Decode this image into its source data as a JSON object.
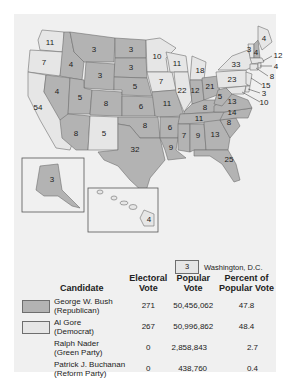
{
  "colors": {
    "republican": "#b3b3b3",
    "democrat": "#e6e6e6",
    "border": "#6e6e6e",
    "background": "#f0f0f0"
  },
  "states": [
    {
      "abbr": "WA",
      "ev": 11,
      "party": "dem"
    },
    {
      "abbr": "OR",
      "ev": 7,
      "party": "dem"
    },
    {
      "abbr": "CA",
      "ev": 54,
      "party": "dem"
    },
    {
      "abbr": "ID",
      "ev": 4,
      "party": "rep"
    },
    {
      "abbr": "NV",
      "ev": 4,
      "party": "rep"
    },
    {
      "abbr": "MT",
      "ev": 3,
      "party": "rep"
    },
    {
      "abbr": "WY",
      "ev": 3,
      "party": "rep"
    },
    {
      "abbr": "UT",
      "ev": 5,
      "party": "rep"
    },
    {
      "abbr": "AZ",
      "ev": 8,
      "party": "rep"
    },
    {
      "abbr": "CO",
      "ev": 8,
      "party": "rep"
    },
    {
      "abbr": "NM",
      "ev": 5,
      "party": "dem"
    },
    {
      "abbr": "ND",
      "ev": 3,
      "party": "rep"
    },
    {
      "abbr": "SD",
      "ev": 3,
      "party": "rep"
    },
    {
      "abbr": "NE",
      "ev": 5,
      "party": "rep"
    },
    {
      "abbr": "KS",
      "ev": 6,
      "party": "rep"
    },
    {
      "abbr": "OK",
      "ev": 8,
      "party": "rep"
    },
    {
      "abbr": "TX",
      "ev": 32,
      "party": "rep"
    },
    {
      "abbr": "MN",
      "ev": 10,
      "party": "dem"
    },
    {
      "abbr": "IA",
      "ev": 7,
      "party": "dem"
    },
    {
      "abbr": "MO",
      "ev": 11,
      "party": "rep"
    },
    {
      "abbr": "AR",
      "ev": 6,
      "party": "rep"
    },
    {
      "abbr": "LA",
      "ev": 9,
      "party": "rep"
    },
    {
      "abbr": "WI",
      "ev": 11,
      "party": "dem"
    },
    {
      "abbr": "IL",
      "ev": 22,
      "party": "dem"
    },
    {
      "abbr": "MI",
      "ev": 18,
      "party": "dem"
    },
    {
      "abbr": "IN",
      "ev": 12,
      "party": "rep"
    },
    {
      "abbr": "OH",
      "ev": 21,
      "party": "rep"
    },
    {
      "abbr": "KY",
      "ev": 8,
      "party": "rep"
    },
    {
      "abbr": "TN",
      "ev": 11,
      "party": "rep"
    },
    {
      "abbr": "MS",
      "ev": 7,
      "party": "rep"
    },
    {
      "abbr": "AL",
      "ev": 9,
      "party": "rep"
    },
    {
      "abbr": "GA",
      "ev": 13,
      "party": "rep"
    },
    {
      "abbr": "FL",
      "ev": 25,
      "party": "rep"
    },
    {
      "abbr": "SC",
      "ev": 8,
      "party": "rep"
    },
    {
      "abbr": "NC",
      "ev": 14,
      "party": "rep"
    },
    {
      "abbr": "VA",
      "ev": 13,
      "party": "rep"
    },
    {
      "abbr": "WV",
      "ev": 5,
      "party": "rep"
    },
    {
      "abbr": "PA",
      "ev": 23,
      "party": "dem"
    },
    {
      "abbr": "NY",
      "ev": 33,
      "party": "dem"
    },
    {
      "abbr": "VT",
      "ev": 3,
      "party": "dem"
    },
    {
      "abbr": "NH",
      "ev": 4,
      "party": "rep"
    },
    {
      "abbr": "ME",
      "ev": 4,
      "party": "dem"
    },
    {
      "abbr": "MA",
      "ev": 12,
      "party": "dem"
    },
    {
      "abbr": "RI",
      "ev": 4,
      "party": "dem"
    },
    {
      "abbr": "CT",
      "ev": 8,
      "party": "dem"
    },
    {
      "abbr": "NJ",
      "ev": 15,
      "party": "dem"
    },
    {
      "abbr": "DE",
      "ev": 3,
      "party": "dem"
    },
    {
      "abbr": "MD",
      "ev": 10,
      "party": "dem"
    },
    {
      "abbr": "AK",
      "ev": 3,
      "party": "rep"
    },
    {
      "abbr": "HI",
      "ev": 4,
      "party": "dem"
    }
  ],
  "dc": {
    "ev": "3",
    "label": "Washington, D.C."
  },
  "table": {
    "headers": [
      "Candidate",
      "Electoral Vote",
      "Popular Vote",
      "Percent of Popular Vote"
    ],
    "header_lines": [
      [
        "Candidate"
      ],
      [
        "Electoral",
        "Vote"
      ],
      [
        "Popular",
        "Vote"
      ],
      [
        "Percent of",
        "Popular Vote"
      ]
    ],
    "rows": [
      {
        "name": "George W. Bush",
        "party": "(Republican)",
        "electoral": "271",
        "popular": "50,456,062",
        "percent": "47.8",
        "swatch": "rep"
      },
      {
        "name": "Al Gore",
        "party": "(Democrat)",
        "electoral": "267",
        "popular": "50,996,862",
        "percent": "48.4",
        "swatch": "dem"
      },
      {
        "name": "Ralph Nader",
        "party": "(Green Party)",
        "electoral": "0",
        "popular": "2,858,843",
        "percent": "2.7",
        "swatch": ""
      },
      {
        "name": "Patrick J. Buchanan",
        "party": "(Reform Party)",
        "electoral": "0",
        "popular": "438,760",
        "percent": "0.4",
        "swatch": ""
      }
    ]
  },
  "labels": {
    "WA": "11",
    "OR": "7",
    "CA": "54",
    "ID": "4",
    "NV": "4",
    "MT": "3",
    "WY": "3",
    "UT": "5",
    "AZ": "8",
    "CO": "8",
    "NM": "5",
    "ND": "3",
    "SD": "3",
    "NE": "5",
    "KS": "6",
    "OK": "8",
    "TX": "32",
    "MN": "10",
    "IA": "7",
    "MO": "11",
    "AR": "6",
    "LA": "9",
    "WI": "11",
    "IL": "22",
    "MI": "18",
    "IN": "12",
    "OH": "21",
    "KY": "8",
    "TN": "11",
    "MS": "7",
    "AL": "9",
    "GA": "13",
    "FL": "25",
    "SC": "8",
    "NC": "14",
    "VA": "13",
    "WV": "5",
    "PA": "23",
    "NY": "33",
    "VT": "3",
    "NH": "4",
    "ME": "4",
    "MA": "12",
    "RI": "4",
    "CT": "8",
    "NJ": "15",
    "DE": "3",
    "MD": "10",
    "AK": "3",
    "HI": "4"
  }
}
